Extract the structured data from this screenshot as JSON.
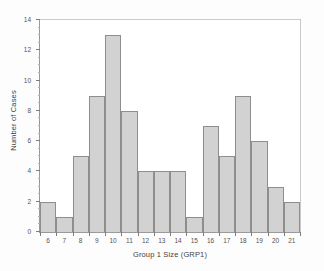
{
  "chart_data": {
    "type": "bar",
    "title": "",
    "xlabel": "Group 1 Size (GRP1)",
    "ylabel": "Number of Cases",
    "categories": [
      "6",
      "7",
      "8",
      "9",
      "10",
      "11",
      "12",
      "13",
      "14",
      "15",
      "16",
      "17",
      "18",
      "19",
      "20",
      "21"
    ],
    "values": [
      2,
      1,
      5,
      9,
      13,
      8,
      4,
      4,
      4,
      1,
      7,
      5,
      9,
      6,
      3,
      2
    ],
    "ylim": [
      0,
      14
    ],
    "y_ticks": [
      0,
      2,
      4,
      6,
      8,
      10,
      12,
      14
    ],
    "y_tick_labels": [
      "0",
      "2",
      "4",
      "6",
      "8",
      "10",
      "12",
      "14"
    ],
    "y_minor_tick_step": 0.5,
    "x_tick_labels": [
      "6",
      "7",
      "8",
      "9",
      "10",
      "11",
      "12",
      "13",
      "14",
      "15",
      "16",
      "17",
      "18",
      "19",
      "20",
      "21"
    ],
    "grid": false,
    "legend": null,
    "bar_fill_color": "#d2d2d2",
    "bar_edge_color": "#8e8e8e",
    "axis_color": "#9a9a9a",
    "background_color": "#ffffff"
  }
}
